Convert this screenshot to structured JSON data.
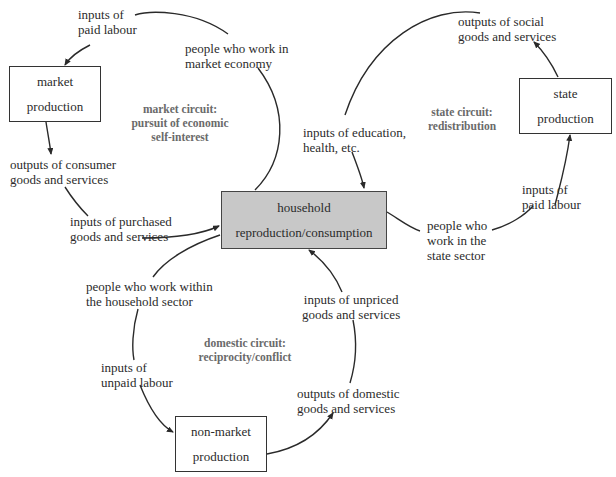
{
  "nodes": {
    "market": {
      "line1": "market",
      "line2": "production"
    },
    "state": {
      "line1": "state",
      "line2": "production"
    },
    "household": {
      "line1": "household",
      "line2": "reproduction/consumption"
    },
    "nonmarket": {
      "line1": "non-market",
      "line2": "production"
    }
  },
  "circuits": {
    "market": {
      "line1": "market circuit:",
      "line2": "pursuit of economic",
      "line3": "self-interest"
    },
    "state": {
      "line1": "state circuit:",
      "line2": "redistribution"
    },
    "domestic": {
      "line1": "domestic circuit:",
      "line2": "reciprocity/conflict"
    }
  },
  "labels": {
    "inputs_paid_labour_market": {
      "line1": "inputs of",
      "line2": "paid labour"
    },
    "people_market_economy": {
      "line1": "people who work in",
      "line2": "market economy"
    },
    "outputs_consumer": {
      "line1": "outputs of consumer",
      "line2": "goods and services"
    },
    "inputs_purchased": {
      "line1": "inputs of purchased",
      "line2": "goods and services"
    },
    "outputs_social": {
      "line1": "outputs of social",
      "line2": "goods and services"
    },
    "inputs_education": {
      "line1": "inputs of education,",
      "line2": "health, etc."
    },
    "inputs_paid_labour_state": {
      "line1": "inputs of",
      "line2": "paid labour"
    },
    "people_state_sector": {
      "line1": "people who",
      "line2": "work in the",
      "line3": "state sector"
    },
    "people_household_sector": {
      "line1": "people who work within",
      "line2": "the household sector"
    },
    "inputs_unpaid_labour": {
      "line1": "inputs of",
      "line2": "unpaid labour"
    },
    "inputs_unpriced": {
      "line1": "inputs of unpriced",
      "line2": "goods and services"
    },
    "outputs_domestic": {
      "line1": "outputs of domestic",
      "line2": "goods and services"
    }
  },
  "colors": {
    "household_fill": "#c8c8c8",
    "circuit_text": "#6a6a6a",
    "line": "#2a2a2a"
  }
}
